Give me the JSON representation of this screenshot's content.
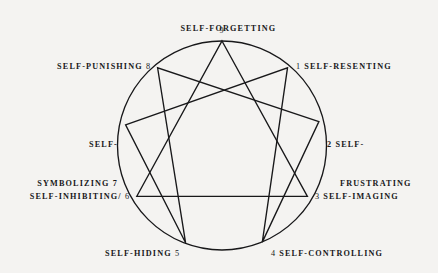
{
  "diagram": {
    "type": "enneagram",
    "background_color": "#f4f3f1",
    "ink_color": "#18181a",
    "circle": {
      "cx": 222,
      "cy": 145.5,
      "r": 104.5
    },
    "points": [
      {
        "number": "9",
        "label": "SELF-FORGETTING",
        "label_lines": [
          "SELF-FORGETTING"
        ],
        "position": "top",
        "number_side": "below",
        "x": 222.0,
        "y": 41.0
      },
      {
        "number": "1",
        "label": "SELF-RESENTING",
        "label_lines": [
          "SELF-RESENTING"
        ],
        "position": "upper-right",
        "number_side": "left",
        "x": 287.5,
        "y": 67.8
      },
      {
        "number": "2",
        "label": "SELF-FRUSTRATING",
        "label_lines": [
          "2 SELF-",
          "FRUSTRATING"
        ],
        "position": "right-upper",
        "number_side": "left",
        "x": 318.9,
        "y": 121.6
      },
      {
        "number": "3",
        "label": "SELF-IMAGING",
        "label_lines": [
          "SELF-IMAGING"
        ],
        "position": "right-lower",
        "number_side": "left",
        "x": 307.4,
        "y": 196.3
      },
      {
        "number": "4",
        "label": "SELF-CONTROLLING",
        "label_lines": [
          "SELF-CONTROLLING"
        ],
        "position": "bottom-right",
        "number_side": "left",
        "x": 262.3,
        "y": 242.1
      },
      {
        "number": "5",
        "label": "SELF-HIDING",
        "label_lines": [
          "SELF-HIDING"
        ],
        "position": "bottom-left",
        "number_side": "right",
        "x": 185.6,
        "y": 242.8
      },
      {
        "number": "6",
        "label": "SELF-INHIBITING/",
        "label_lines": [
          "SELF-INHIBITING/"
        ],
        "position": "left-lower",
        "number_side": "right",
        "x": 136.8,
        "y": 196.3
      },
      {
        "number": "7",
        "label": "SELF-SYMBOLIZING",
        "label_lines": [
          "SELF-",
          "SYMBOLIZING 7"
        ],
        "position": "left-upper",
        "number_side": "right",
        "x": 125.6,
        "y": 124.9
      },
      {
        "number": "8",
        "label": "SELF-PUNISHING",
        "label_lines": [
          "SELF-PUNISHING"
        ],
        "position": "upper-left",
        "number_side": "right",
        "x": 157.6,
        "y": 67.8
      }
    ],
    "triangle_path": [
      "9",
      "3",
      "6",
      "9"
    ],
    "hexad_path": [
      "1",
      "4",
      "2",
      "8",
      "5",
      "7",
      "1"
    ],
    "labels": {
      "nine": "SELF-FORGETTING",
      "nine_num": "9",
      "one_num": "1",
      "one": "SELF-RESENTING",
      "two_line1": "2 SELF-",
      "two_line2": "FRUSTRATING",
      "three_num": "3",
      "three": "SELF-IMAGING",
      "four_num": "4",
      "four": "SELF-CONTROLLING",
      "five": "SELF-HIDING",
      "five_num": "5",
      "six": "SELF-INHIBITING/",
      "six_num": "6",
      "seven_line1": "SELF-",
      "seven_line2": "SYMBOLIZING 7",
      "eight": "SELF-PUNISHING",
      "eight_num": "8"
    }
  }
}
